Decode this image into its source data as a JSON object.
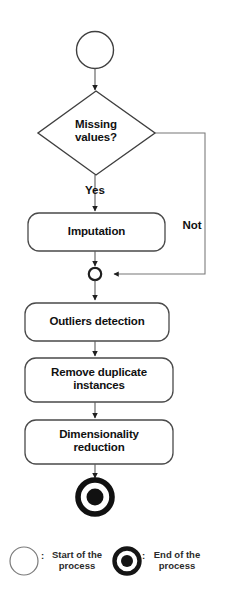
{
  "diagram": {
    "type": "flowchart",
    "line_color": "#3a3a3a",
    "text_color": "#111111",
    "background": "#ffffff"
  },
  "nodes": {
    "start": {
      "name": "start-node",
      "shape": "circle",
      "label": ""
    },
    "decision": {
      "name": "missing-values-decision",
      "shape": "diamond",
      "line1": "Missing",
      "line2": "values?"
    },
    "imputation": {
      "name": "imputation-step",
      "shape": "rounded-rect",
      "label": "Imputation"
    },
    "merge": {
      "name": "merge-node",
      "shape": "small-circle",
      "label": ""
    },
    "outliers": {
      "name": "outliers-detection-step",
      "shape": "rounded-rect",
      "label": "Outliers detection"
    },
    "duplicates": {
      "name": "remove-duplicates-step",
      "shape": "rounded-rect",
      "line1": "Remove duplicate",
      "line2": "instances"
    },
    "dimensionality": {
      "name": "dimensionality-reduction-step",
      "shape": "rounded-rect",
      "line1": "Dimensionality",
      "line2": "reduction"
    },
    "end": {
      "name": "end-node",
      "shape": "bullseye",
      "label": ""
    }
  },
  "branches": {
    "yes": "Yes",
    "not": "Not"
  },
  "legend": {
    "start": {
      "separator": ":",
      "line1": "Start of the",
      "line2": "process"
    },
    "end": {
      "separator": ":",
      "line1": "End of the",
      "line2": "process"
    }
  }
}
